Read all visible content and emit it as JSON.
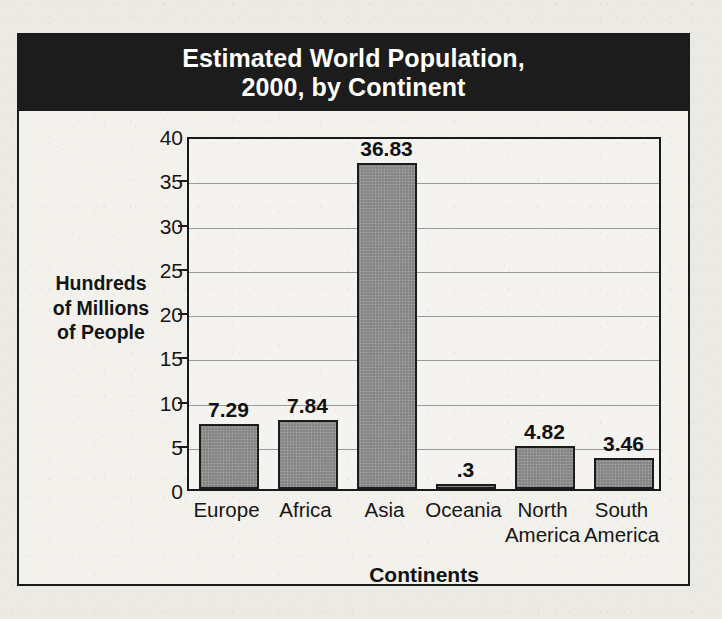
{
  "figure": {
    "title_lines": [
      "Estimated World Population,",
      "2000, by Continent"
    ],
    "colors": {
      "title_band_bg": "#1c1c1c",
      "title_text": "#ffffff",
      "bar_fill": "#8b8b8b",
      "bar_outline": "#1c1c1c",
      "plot_bg": "#f5f3ef",
      "gridline": "#9a9a96",
      "frame": "#1a1a1a",
      "page_bg": "#eceae4"
    }
  },
  "chart_data": {
    "type": "bar",
    "xlabel": "Continents",
    "ylabel": "Hundreds of Millions of People",
    "ylabel_lines": [
      "Hundreds",
      "of Millions",
      "of People"
    ],
    "categories": [
      "Europe",
      "Africa",
      "Asia",
      "Oceania",
      "North America",
      "South America"
    ],
    "category_label_lines": [
      [
        "Europe"
      ],
      [
        "Africa"
      ],
      [
        "Asia"
      ],
      [
        "Oceania"
      ],
      [
        "North",
        "America"
      ],
      [
        "South",
        "America"
      ]
    ],
    "values": [
      7.29,
      7.84,
      36.83,
      0.3,
      4.82,
      3.46
    ],
    "value_labels": [
      "7.29",
      "7.84",
      "36.83",
      ".3",
      "4.82",
      "3.46"
    ],
    "ylim": [
      0,
      40
    ],
    "yticks": [
      0,
      5,
      10,
      15,
      20,
      25,
      30,
      35,
      40
    ],
    "ytick_labels": [
      "0",
      "5",
      "10",
      "15",
      "20",
      "25",
      "30",
      "35",
      "40"
    ],
    "grid": true,
    "legend": false,
    "legend_position": "none"
  }
}
